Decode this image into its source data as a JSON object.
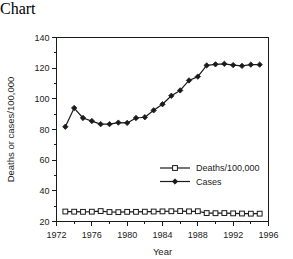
{
  "chart_data": {
    "type": "line",
    "title": "",
    "subtitle": "",
    "xlabel": "Year",
    "ylabel": "Deaths or cases/100,000",
    "xlim": [
      1972,
      1996
    ],
    "ylim": [
      20,
      140
    ],
    "x_major_ticks": [
      1972,
      1976,
      1980,
      1984,
      1988,
      1992,
      1996
    ],
    "x_tick_labels": [
      "1972",
      "1976",
      "1980",
      "1984",
      "1988",
      "1992",
      "1996"
    ],
    "x_minor_step": 2,
    "y_major_ticks": [
      20,
      40,
      60,
      80,
      100,
      120,
      140
    ],
    "y_tick_labels": [
      "20",
      "40",
      "60",
      "80",
      "100",
      "120",
      "140"
    ],
    "y_minor_step": 10,
    "grid": false,
    "legend_position": "center-right",
    "x": [
      1973,
      1974,
      1975,
      1976,
      1977,
      1978,
      1979,
      1980,
      1981,
      1982,
      1983,
      1984,
      1985,
      1986,
      1987,
      1988,
      1989,
      1990,
      1991,
      1992,
      1993,
      1994,
      1995
    ],
    "series": [
      {
        "name": "Deaths/100,000",
        "marker": "open-square",
        "values": [
          26.5,
          26.4,
          26.3,
          26.4,
          26.8,
          26.2,
          26.1,
          26.3,
          26.3,
          26.4,
          26.5,
          26.6,
          26.7,
          26.8,
          26.6,
          26.7,
          25.5,
          25.4,
          25.5,
          25.3,
          25.2,
          25.1,
          25.1
        ]
      },
      {
        "name": "Cases",
        "marker": "filled-diamond",
        "values": [
          81.8,
          94.0,
          87.5,
          85.5,
          83.5,
          83.5,
          84.5,
          84.3,
          87.5,
          88.0,
          92.5,
          96.5,
          102.0,
          105.5,
          112.0,
          114.5,
          121.8,
          122.5,
          122.8,
          122.0,
          121.5,
          122.3,
          122.3
        ]
      }
    ]
  },
  "legend": {
    "entries": [
      {
        "label": "Deaths/100,000"
      },
      {
        "label": "Cases"
      }
    ]
  }
}
